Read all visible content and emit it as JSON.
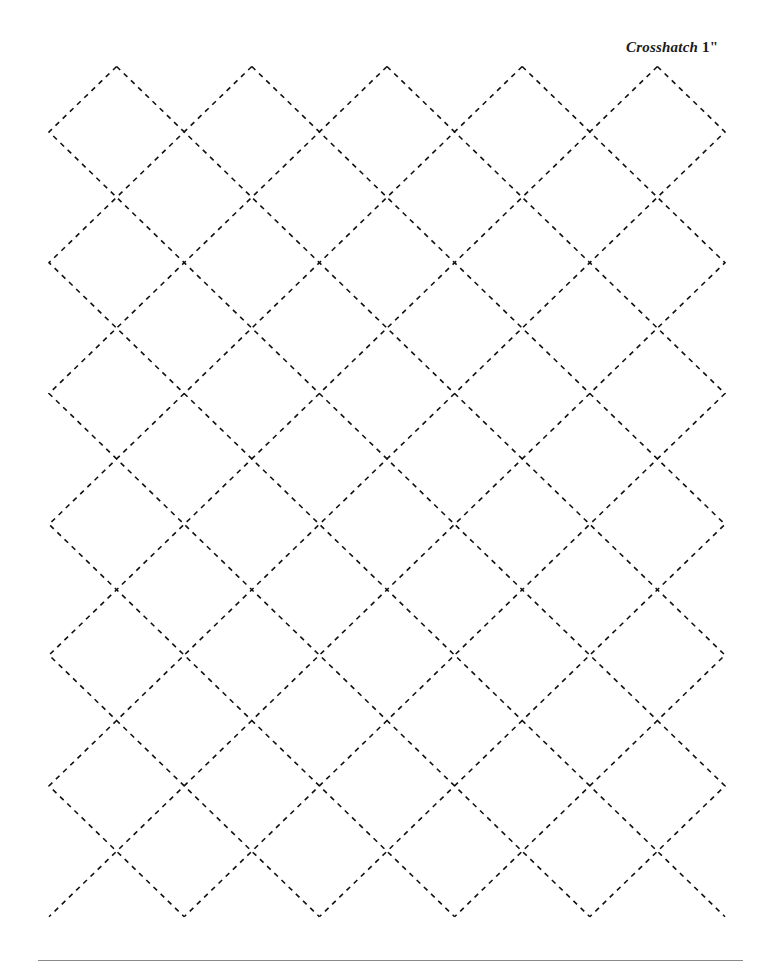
{
  "title": {
    "name": "Crosshatch",
    "size": "1\""
  },
  "pattern": {
    "type": "crosshatch-diamond",
    "origin_x": 49,
    "origin_y": 66.5,
    "half_step_x": 67.6,
    "half_step_y": 65.4,
    "cols": 10,
    "rows": 13,
    "stroke_color": "#111111",
    "stroke_width": 1.6,
    "dash": "5 5"
  },
  "footer": {
    "rule_color": "#8a8a8a"
  }
}
